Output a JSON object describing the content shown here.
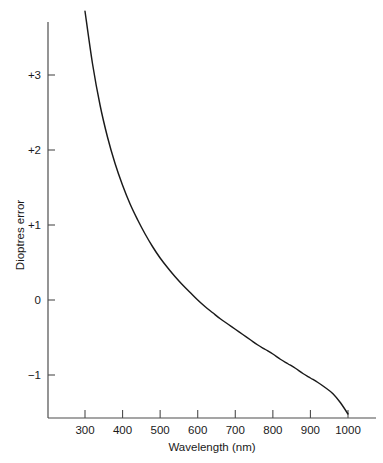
{
  "chart_data": {
    "type": "line",
    "title": "",
    "xlabel": "Wavelength (nm)",
    "ylabel": "Dioptres error",
    "xlim": [
      225,
      1075
    ],
    "ylim": [
      -1.6,
      4.0
    ],
    "grid": false,
    "legend": null,
    "xticks": [
      300,
      400,
      500,
      600,
      700,
      800,
      900,
      1000
    ],
    "xtick_labels": [
      "300",
      "400",
      "500",
      "600",
      "700",
      "800",
      "900",
      "1000"
    ],
    "yticks": [
      -1,
      0,
      1,
      2,
      3
    ],
    "ytick_labels": [
      "−1",
      "0",
      "+1",
      "+2",
      "+3"
    ],
    "series": [
      {
        "name": "Chromatic aberration of the eye",
        "x": [
          300,
          320,
          340,
          360,
          380,
          400,
          420,
          440,
          460,
          480,
          500,
          520,
          540,
          560,
          580,
          600,
          620,
          640,
          660,
          680,
          700,
          720,
          740,
          760,
          780,
          800,
          820,
          840,
          860,
          880,
          900,
          920,
          940,
          960,
          980,
          1000
        ],
        "values": [
          3.85,
          3.15,
          2.6,
          2.17,
          1.82,
          1.53,
          1.28,
          1.07,
          0.88,
          0.71,
          0.56,
          0.43,
          0.31,
          0.2,
          0.1,
          0.0,
          -0.09,
          -0.17,
          -0.25,
          -0.32,
          -0.39,
          -0.46,
          -0.53,
          -0.6,
          -0.66,
          -0.72,
          -0.79,
          -0.85,
          -0.91,
          -0.98,
          -1.04,
          -1.1,
          -1.17,
          -1.25,
          -1.37,
          -1.52
        ]
      }
    ]
  },
  "axes": {
    "x_axis_title": "Wavelength (nm)",
    "y_axis_title": "Dioptres error"
  },
  "colors": {
    "curve": "#1a1a1a",
    "axis": "#4d4d4d",
    "background": "#ffffff",
    "text": "#1a1a1a"
  }
}
